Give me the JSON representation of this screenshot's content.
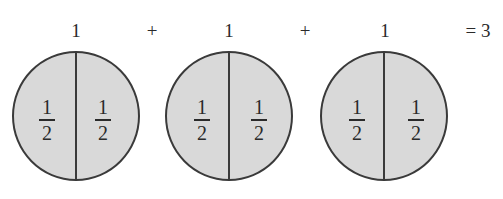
{
  "equation": {
    "terms": [
      {
        "label": "1",
        "halves": [
          {
            "numerator": "1",
            "denominator": "2"
          },
          {
            "numerator": "1",
            "denominator": "2"
          }
        ]
      },
      {
        "label": "1",
        "halves": [
          {
            "numerator": "1",
            "denominator": "2"
          },
          {
            "numerator": "1",
            "denominator": "2"
          }
        ]
      },
      {
        "label": "1",
        "halves": [
          {
            "numerator": "1",
            "denominator": "2"
          },
          {
            "numerator": "1",
            "denominator": "2"
          }
        ]
      }
    ],
    "operators": [
      "+",
      "+"
    ],
    "result": "= 3"
  },
  "colors": {
    "fill": "#d9d9d9",
    "stroke": "#3a3a3a"
  }
}
